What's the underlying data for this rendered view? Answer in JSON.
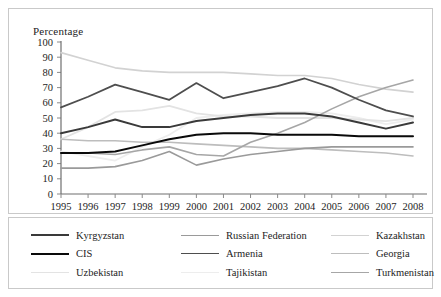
{
  "chart_data": {
    "type": "line",
    "title": "",
    "ylabel": "Percentage",
    "xlabel": "",
    "ylim": [
      0,
      100
    ],
    "ytick_step": 10,
    "yticks": [
      "100",
      "90",
      "80",
      "70",
      "60",
      "50",
      "40",
      "30",
      "20",
      "10",
      "0"
    ],
    "grid": false,
    "legend_position": "bottom",
    "categories": [
      "1995",
      "1996",
      "1997",
      "1998",
      "1999",
      "2000",
      "2001",
      "2002",
      "2003",
      "2004",
      "2005",
      "2006",
      "2007",
      "2008"
    ],
    "series": [
      {
        "name": "Kyrgyzstan",
        "color": "#3a3a3a",
        "width": 2.0,
        "values": [
          40,
          44,
          49,
          44,
          44,
          48,
          50,
          52,
          53,
          53,
          51,
          47,
          43,
          47
        ]
      },
      {
        "name": "CIS",
        "color": "#0a0a0a",
        "width": 2.0,
        "values": [
          27,
          27,
          28,
          32,
          36,
          39,
          40,
          40,
          39,
          39,
          39,
          38,
          38,
          38
        ]
      },
      {
        "name": "Uzbekistan",
        "color": "#e3e3e3",
        "width": 1.8,
        "values": [
          36,
          44,
          54,
          55,
          58,
          53,
          51,
          51,
          50,
          50,
          50,
          49,
          48,
          50
        ]
      },
      {
        "name": "Russian Federation",
        "color": "#9a9a9a",
        "width": 1.6,
        "values": [
          17,
          17,
          18,
          22,
          28,
          19,
          23,
          26,
          28,
          30,
          31,
          31,
          31,
          31
        ]
      },
      {
        "name": "Armenia",
        "color": "#4e4e4e",
        "width": 1.8,
        "values": [
          57,
          64,
          72,
          67,
          62,
          73,
          63,
          67,
          71,
          76,
          70,
          62,
          55,
          51
        ]
      },
      {
        "name": "Tajikistan",
        "color": "#ededed",
        "width": 1.8,
        "values": [
          28,
          25,
          22,
          31,
          39,
          50,
          52,
          53,
          54,
          54,
          53,
          50,
          46,
          49
        ]
      },
      {
        "name": "Kazakhstan",
        "color": "#d2d2d2",
        "width": 1.6,
        "values": [
          93,
          88,
          83,
          81,
          80,
          80,
          80,
          79,
          78,
          78,
          76,
          72,
          69,
          67
        ]
      },
      {
        "name": "Georgia",
        "color": "#bdbdbd",
        "width": 1.6,
        "values": [
          36,
          35,
          35,
          34,
          34,
          33,
          32,
          31,
          30,
          30,
          29,
          28,
          27,
          25
        ]
      },
      {
        "name": "Turkmenistan",
        "color": "#a6a6a6",
        "width": 1.6,
        "values": [
          27,
          27,
          26,
          29,
          31,
          26,
          25,
          34,
          40,
          47,
          56,
          64,
          70,
          75
        ]
      }
    ],
    "legend_order": [
      [
        "Kyrgyzstan",
        "Russian Federation",
        "Kazakhstan"
      ],
      [
        "CIS",
        "Armenia",
        "Georgia"
      ],
      [
        "Uzbekistan",
        "Tajikistan",
        "Turkmenistan"
      ]
    ]
  }
}
